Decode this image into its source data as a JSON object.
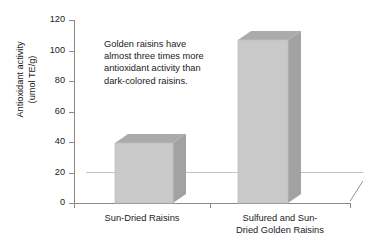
{
  "chart_data": {
    "type": "bar",
    "title": "",
    "subtitle": "",
    "xlabel": "",
    "ylabel": "Antioxidant activity (umol TE/g)",
    "ylabel_line1": "Antioxidant activity",
    "ylabel_line2": "(umol TE/g)",
    "categories": [
      "Sun-Dried Raisins",
      "Sulfured and Sun-Dried Golden Raisins"
    ],
    "category_display": [
      {
        "line1": "Sun-Dried Raisins",
        "line2": ""
      },
      {
        "line1": "Sulfured and Sun-",
        "line2": "Dried Golden Raisins"
      }
    ],
    "values": [
      40,
      110
    ],
    "ylim": [
      0,
      120
    ],
    "ytick_values": [
      0,
      20,
      40,
      60,
      80,
      100,
      120
    ],
    "ytick_labels": [
      "0",
      "20",
      "40",
      "60",
      "80",
      "100",
      "120"
    ],
    "grid": false,
    "legend": false,
    "legend_position": "none",
    "style": "3d-column",
    "annotations": [
      {
        "text": "Golden raisins have almost three times more antioxidant activity than dark-colored raisins.",
        "lines": [
          "Golden raisins have",
          "almost three times more",
          "antioxidant activity than",
          "dark-colored raisins."
        ]
      }
    ],
    "colors": {
      "bar_front": "#c9c9c9",
      "bar_side": "#a2a2a2",
      "bar_top": "#ababab",
      "axis": "#8a8a8a",
      "text": "#1a1a1a",
      "background": "#ffffff"
    }
  }
}
